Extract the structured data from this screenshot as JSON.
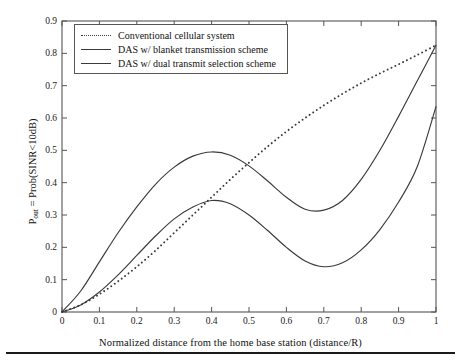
{
  "chart_data": {
    "type": "line",
    "title": "",
    "subtitle": "",
    "xlabel": "Normalized distance from the home base station (distance/R)",
    "ylabel": "P_out = Prob(SINR<10dB)",
    "ylabel_base": "P",
    "ylabel_sub": "out",
    "ylabel_rest": " = Prob(SINR<10dB)",
    "xlim": [
      0,
      1
    ],
    "ylim": [
      0,
      0.9
    ],
    "grid": false,
    "legend_position": "upper-left-inside",
    "xticks": [
      0,
      0.1,
      0.2,
      0.3,
      0.4,
      0.5,
      0.6,
      0.7,
      0.8,
      0.9,
      1
    ],
    "xticklabels": [
      "0",
      "0.1",
      "0.2",
      "0.3",
      "0.4",
      "0.5",
      "0.6",
      "0.7",
      "0.8",
      "0.9",
      "1"
    ],
    "yticks": [
      0,
      0.1,
      0.2,
      0.3,
      0.4,
      0.5,
      0.6,
      0.7,
      0.8,
      0.9
    ],
    "yticklabels": [
      "0",
      "0.1",
      "0.2",
      "0.3",
      "0.4",
      "0.5",
      "0.6",
      "0.7",
      "0.8",
      "0.9"
    ],
    "x": [
      0,
      0.05,
      0.1,
      0.15,
      0.2,
      0.25,
      0.3,
      0.35,
      0.4,
      0.45,
      0.5,
      0.55,
      0.6,
      0.65,
      0.7,
      0.75,
      0.8,
      0.85,
      0.9,
      0.95,
      1
    ],
    "series": [
      {
        "name": "Conventional cellular system",
        "style": "dotted",
        "color": "#3a3a3a",
        "values": [
          0.0,
          0.022,
          0.055,
          0.095,
          0.14,
          0.19,
          0.245,
          0.3,
          0.355,
          0.41,
          0.462,
          0.512,
          0.558,
          0.6,
          0.639,
          0.675,
          0.708,
          0.738,
          0.766,
          0.795,
          0.825
        ]
      },
      {
        "name": "DAS w/ blanket transmission scheme",
        "style": "solid",
        "color": "#3a3a3a",
        "values": [
          0.0,
          0.065,
          0.155,
          0.245,
          0.325,
          0.395,
          0.448,
          0.482,
          0.495,
          0.485,
          0.452,
          0.405,
          0.355,
          0.318,
          0.315,
          0.345,
          0.41,
          0.5,
          0.605,
          0.715,
          0.825
        ]
      },
      {
        "name": "DAS w/ dual transmit selection scheme",
        "style": "solid",
        "color": "#3a3a3a",
        "values": [
          0.0,
          0.022,
          0.062,
          0.115,
          0.175,
          0.235,
          0.288,
          0.325,
          0.345,
          0.335,
          0.3,
          0.252,
          0.2,
          0.158,
          0.14,
          0.152,
          0.192,
          0.255,
          0.34,
          0.45,
          0.635
        ]
      }
    ]
  },
  "legend": {
    "items": [
      {
        "label": "Conventional cellular system",
        "style": "dotted"
      },
      {
        "label": "DAS w/ blanket transmission scheme",
        "style": "solid"
      },
      {
        "label": "DAS w/ dual transmit selection scheme",
        "style": "solid"
      }
    ]
  },
  "colors": {
    "line": "#3a3a3a",
    "axis": "#555555",
    "text": "#111111",
    "background": "#ffffff"
  }
}
